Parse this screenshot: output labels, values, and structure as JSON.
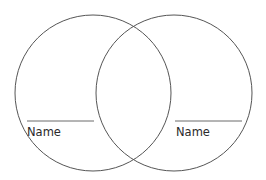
{
  "diagram": {
    "type": "venn",
    "stroke_color": "#555555",
    "line_color": "#6a6a6a",
    "circles": [
      {
        "id": "left",
        "cx": 93,
        "cy": 93,
        "r": 78,
        "label": "Name"
      },
      {
        "id": "right",
        "cx": 174,
        "cy": 93,
        "r": 78,
        "label": "Name"
      }
    ],
    "name_lines": [
      {
        "id": "left",
        "x1": 27,
        "x2": 94,
        "y": 121
      },
      {
        "id": "right",
        "x1": 175,
        "x2": 242,
        "y": 121
      }
    ]
  }
}
